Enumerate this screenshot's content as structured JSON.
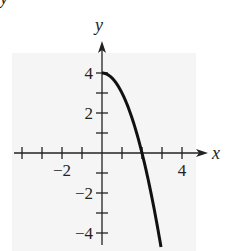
{
  "chart_data": {
    "type": "line",
    "title": "",
    "xlabel": "x",
    "ylabel": "y",
    "xlim": [
      -4.5,
      5.3
    ],
    "ylim": [
      -4.5,
      5.6
    ],
    "grid": false,
    "legend": null,
    "x_ticks": [
      -4,
      -3,
      -2,
      -1,
      1,
      2,
      3,
      4
    ],
    "y_ticks": [
      4,
      3,
      2,
      1,
      -1,
      -2,
      -3,
      -4
    ],
    "x_tick_labels": [
      {
        "value": -2,
        "label": "−2"
      },
      {
        "value": 4,
        "label": "4"
      }
    ],
    "y_tick_labels": [
      {
        "value": 4,
        "label": "4"
      },
      {
        "value": 2,
        "label": "2"
      },
      {
        "value": -2,
        "label": "−2"
      },
      {
        "value": -4,
        "label": "−4"
      }
    ],
    "series": [
      {
        "name": "y = 4 − x², x ≥ 0",
        "color": "#111111",
        "x": [
          0,
          0.25,
          0.5,
          0.75,
          1,
          1.25,
          1.5,
          1.75,
          2,
          2.25,
          2.5,
          2.75,
          2.95
        ],
        "y": [
          4,
          3.94,
          3.75,
          3.44,
          3,
          2.44,
          1.75,
          0.94,
          0,
          -1.06,
          -2.25,
          -3.56,
          -4.7
        ]
      }
    ]
  },
  "colors": {
    "background": "#ffffff",
    "panel": "#f5f5f5",
    "axis": "#222222",
    "curve": "#111111"
  }
}
